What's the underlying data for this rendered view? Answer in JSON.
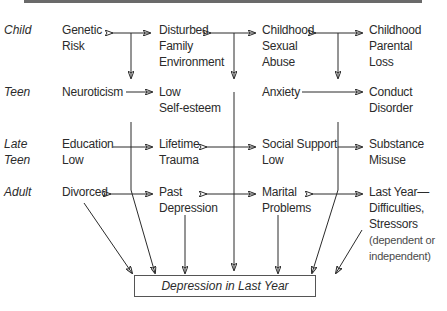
{
  "stages": [
    "Child",
    "Teen",
    "Late Teen",
    "Adult"
  ],
  "nodes": {
    "genetic_risk": [
      "Genetic",
      "Risk"
    ],
    "disturbed_family": [
      "Disturbed",
      "Family",
      "Environment"
    ],
    "sexual_abuse": [
      "Childhood",
      "Sexual",
      "Abuse"
    ],
    "parental_loss": [
      "Childhood",
      "Parental",
      "Loss"
    ],
    "neuroticism": [
      "Neuroticism"
    ],
    "low_self_esteem": [
      "Low",
      "Self-esteem"
    ],
    "anxiety": [
      "Anxiety"
    ],
    "conduct_disorder": [
      "Conduct",
      "Disorder"
    ],
    "education_low": [
      "Education",
      "Low"
    ],
    "lifetime_trauma": [
      "Lifetime",
      "Trauma"
    ],
    "social_support_low": [
      "Social Support",
      "Low"
    ],
    "substance_misuse": [
      "Substance",
      "Misuse"
    ],
    "divorced": [
      "Divorced"
    ],
    "past_depression": [
      "Past",
      "Depression"
    ],
    "marital_problems": [
      "Marital",
      "Problems"
    ],
    "last_year_difficulties": [
      "Last Year—",
      "Difficulties,",
      "Stressors",
      "(dependent or",
      "independent)"
    ]
  },
  "outcome": "Depression in Last Year"
}
